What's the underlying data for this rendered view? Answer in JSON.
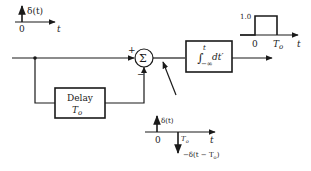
{
  "diagram": {
    "input_signal": {
      "label": "δ(t)",
      "origin_label": "0",
      "axis_label": "t"
    },
    "summing_junction": {
      "symbol": "Σ",
      "plus_sign": "+",
      "minus_sign": "−"
    },
    "integrator": {
      "upper_limit": "t",
      "lower_limit": "−∞",
      "integrand": "dt′"
    },
    "delay_block": {
      "title": "Delay",
      "param": "T",
      "param_sub": "o"
    },
    "output_signal": {
      "amplitude_label": "1.0",
      "origin_label": "0",
      "end_label": "T",
      "end_label_sub": "o",
      "axis_label": "t"
    },
    "junction_signal": {
      "impulse_label": "δ(t)",
      "origin_label": "0",
      "delay_label": "T",
      "delay_label_sub": "o",
      "axis_label": "t",
      "neg_impulse_label": "−δ(t − T",
      "neg_impulse_label_sub": "o",
      "neg_impulse_label_end": ")"
    }
  }
}
